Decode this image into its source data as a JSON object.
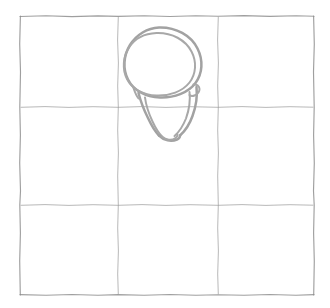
{
  "scene": {
    "title": "Hand-drawn bucket on a 3x3 grid",
    "background_color": "#ffffff",
    "width": 330,
    "height": 308,
    "medium": "pencil sketch"
  },
  "grid": {
    "name": "three-by-three-grid",
    "rows": 3,
    "columns": 3,
    "line_color": "#8e8e8e",
    "line_style": "sketchy-dashed-pencil",
    "bounds": {
      "left": 20,
      "top": 16,
      "right": 314,
      "bottom": 295
    },
    "vertical_line_x": [
      118,
      218
    ],
    "horizontal_line_y": [
      107,
      205
    ],
    "cells": [
      {
        "id": "cell-r1c1",
        "row": 1,
        "col": 1,
        "occupied": false
      },
      {
        "id": "cell-r1c2",
        "row": 1,
        "col": 2,
        "occupied": true
      },
      {
        "id": "cell-r1c3",
        "row": 1,
        "col": 3,
        "occupied": false
      },
      {
        "id": "cell-r2c1",
        "row": 2,
        "col": 1,
        "occupied": false
      },
      {
        "id": "cell-r2c2",
        "row": 2,
        "col": 2,
        "occupied": true
      },
      {
        "id": "cell-r2c3",
        "row": 2,
        "col": 3,
        "occupied": false
      },
      {
        "id": "cell-r3c1",
        "row": 3,
        "col": 1,
        "occupied": false
      },
      {
        "id": "cell-r3c2",
        "row": 3,
        "col": 2,
        "occupied": false
      },
      {
        "id": "cell-r3c3",
        "row": 3,
        "col": 3,
        "occupied": false
      }
    ]
  },
  "object": {
    "name": "bucket",
    "label": "bucket",
    "stroke_color": "#a2a2a2",
    "stroke_width": 2.5,
    "orientation": "tilted",
    "bounds": {
      "left": 124,
      "top": 27,
      "right": 203,
      "bottom": 142
    },
    "parts": [
      {
        "name": "rim-outer",
        "description": "outer elliptical rim of the bucket, tilted"
      },
      {
        "name": "rim-inner",
        "description": "inner ellipse line just inside the rim"
      },
      {
        "name": "body",
        "description": "tapering body walls descending down-right"
      },
      {
        "name": "base",
        "description": "rounded bottom of the bucket"
      },
      {
        "name": "handle-lug",
        "description": "small notch on the right side where a handle attaches"
      }
    ]
  }
}
